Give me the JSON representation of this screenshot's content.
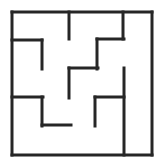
{
  "figure": {
    "name": "maze-grid-puzzle",
    "kind": "line-drawing",
    "background_color": "#ffffff",
    "wall_color": "#262626",
    "wall_thickness": 3,
    "canvas": {
      "width": 165,
      "height": 168
    },
    "bounds": {
      "left": 12,
      "top": 12,
      "right": 152,
      "bottom": 155
    }
  },
  "walls": {
    "border": [
      {
        "id": "border-top",
        "x1": 12,
        "y1": 12,
        "x2": 152,
        "y2": 12
      },
      {
        "id": "border-right",
        "x1": 152,
        "y1": 12,
        "x2": 152,
        "y2": 155
      },
      {
        "id": "border-bottom",
        "x1": 152,
        "y1": 155,
        "x2": 12,
        "y2": 155
      },
      {
        "id": "border-left",
        "x1": 12,
        "y1": 155,
        "x2": 12,
        "y2": 12
      }
    ],
    "interior": [
      {
        "id": "wall-top-stub-left",
        "orientation": "vertical",
        "x1": 69,
        "y1": 12,
        "x2": 69,
        "y2": 39
      },
      {
        "id": "wall-top-stub-right",
        "orientation": "vertical",
        "x1": 123,
        "y1": 12,
        "x2": 123,
        "y2": 39
      },
      {
        "id": "wall-upper-left-arm",
        "orientation": "horizontal",
        "x1": 12,
        "y1": 40,
        "x2": 42,
        "y2": 40
      },
      {
        "id": "wall-upper-left-drop",
        "orientation": "vertical",
        "x1": 42,
        "y1": 40,
        "x2": 42,
        "y2": 69
      },
      {
        "id": "wall-upper-right-arm",
        "orientation": "horizontal",
        "x1": 97,
        "y1": 39,
        "x2": 124,
        "y2": 39
      },
      {
        "id": "wall-upper-right-drop",
        "orientation": "vertical",
        "x1": 97,
        "y1": 39,
        "x2": 97,
        "y2": 69
      },
      {
        "id": "wall-center-arm",
        "orientation": "horizontal",
        "x1": 69,
        "y1": 68,
        "x2": 98,
        "y2": 68
      },
      {
        "id": "wall-center-drop",
        "orientation": "vertical",
        "x1": 69,
        "y1": 68,
        "x2": 69,
        "y2": 98
      },
      {
        "id": "wall-right-long-divider",
        "orientation": "vertical",
        "x1": 124,
        "y1": 68,
        "x2": 124,
        "y2": 155
      },
      {
        "id": "wall-lower-left-arm",
        "orientation": "horizontal",
        "x1": 12,
        "y1": 97,
        "x2": 43,
        "y2": 97
      },
      {
        "id": "wall-lower-left-drop",
        "orientation": "vertical",
        "x1": 42,
        "y1": 97,
        "x2": 42,
        "y2": 126
      },
      {
        "id": "wall-lower-left-foot",
        "orientation": "horizontal",
        "x1": 42,
        "y1": 125,
        "x2": 71,
        "y2": 125
      },
      {
        "id": "wall-lower-right-arm",
        "orientation": "horizontal",
        "x1": 95,
        "y1": 97,
        "x2": 124,
        "y2": 97
      },
      {
        "id": "wall-lower-right-drop",
        "orientation": "vertical",
        "x1": 95,
        "y1": 97,
        "x2": 95,
        "y2": 126
      }
    ]
  }
}
